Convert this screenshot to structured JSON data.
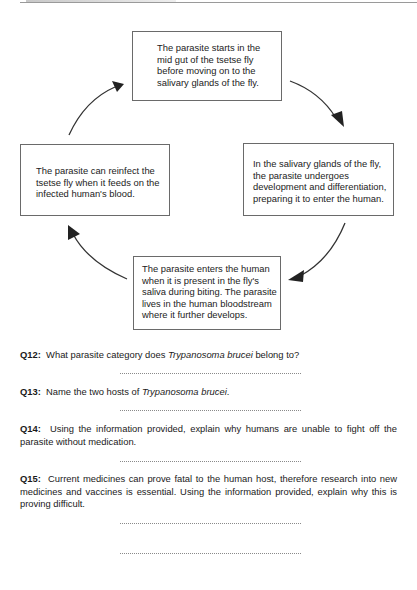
{
  "cycle": {
    "top": "The parasite starts in the mid gut of the tsetse fly before moving on to the salivary glands of the fly.",
    "right": "In the salivary glands of the fly, the parasite undergoes development and differentiation, preparing it to enter the human.",
    "bottom": "The parasite enters the human when it is present in the fly's saliva during biting. The parasite lives in the human bloodstream where it further develops.",
    "left": "The parasite can reinfect the tsetse fly when it feeds on the infected human's blood."
  },
  "questions": [
    {
      "number": "Q12:",
      "text_before": "What parasite category does ",
      "italic": "Trypanosoma brucei",
      "text_after": " belong to?"
    },
    {
      "number": "Q13:",
      "text_before": "Name the two hosts of ",
      "italic": "Trypanosoma brucei",
      "text_after": "."
    },
    {
      "number": "Q14:",
      "text_before": "Using the information provided, explain why humans are unable to fight off the parasite without medication.",
      "italic": "",
      "text_after": ""
    },
    {
      "number": "Q15:",
      "text_before": "Current medicines can prove fatal to the human host, therefore research into new medicines and vaccines is essential. Using the information provided, explain why this is proving difficult.",
      "italic": "",
      "text_after": ""
    }
  ],
  "answer_line": "",
  "colors": {
    "box_border": "#6a6a6a",
    "arrow": "#333333",
    "text": "#1a1a1a",
    "dots": "#8a8a8a"
  }
}
